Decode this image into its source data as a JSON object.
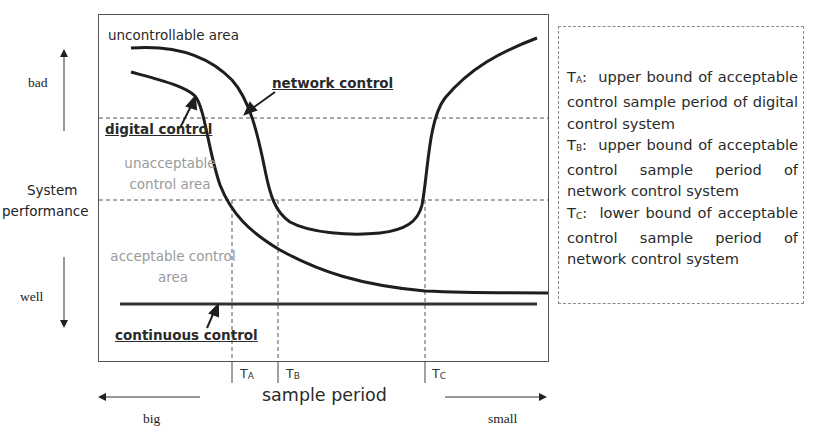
{
  "diagram": {
    "y_axis": {
      "label_line1": "System",
      "label_line2": "performance",
      "top_label": "bad",
      "bottom_label": "well"
    },
    "x_axis": {
      "label": "sample period",
      "left_label": "big",
      "right_label": "small",
      "ticks": [
        {
          "name": "T",
          "sub": "A"
        },
        {
          "name": "T",
          "sub": "B"
        },
        {
          "name": "T",
          "sub": "C"
        }
      ]
    },
    "regions": {
      "top": "uncontrollable area",
      "middle_line1": "unacceptable",
      "middle_line2": "control area",
      "bottom_line1": "acceptable control",
      "bottom_line2": "area"
    },
    "curves": {
      "network": "network control",
      "digital": "digital control",
      "continuous": "continuous control"
    },
    "legend": [
      {
        "sym": "T",
        "sub": "A",
        "sep": ":",
        "text": "upper bound of acceptable control sample period of digital control system"
      },
      {
        "sym": "T",
        "sub": "B",
        "sep": ":",
        "text": "upper bound of acceptable control sample period of network control system"
      },
      {
        "sym": "T",
        "sub": "C",
        "sep": ":",
        "text": "lower bound of acceptable control sample period of network control system"
      }
    ]
  }
}
